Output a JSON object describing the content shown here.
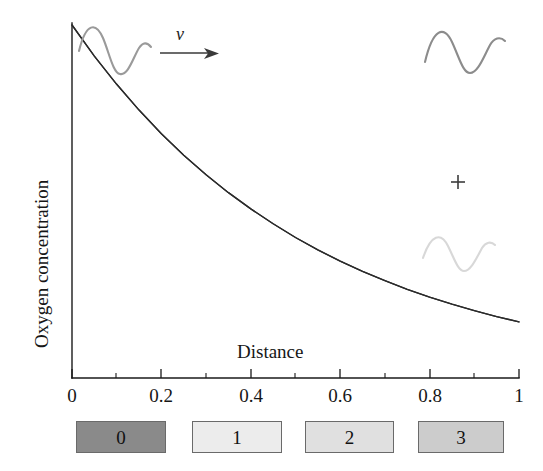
{
  "chart_data": {
    "type": "line",
    "title": "",
    "xlabel": "Distance",
    "ylabel": "Oxygen concentration",
    "xlim": [
      0,
      1
    ],
    "ylim": [
      0,
      1
    ],
    "grid": false,
    "legend_position": "below-axes",
    "x_tick_labels": [
      "0",
      "0.2",
      "0.4",
      "0.6",
      "0.8",
      "1"
    ],
    "x_tick_values": [
      0,
      0.2,
      0.4,
      0.6,
      0.8,
      1
    ],
    "x_minor_tick_values": [
      0.1,
      0.3,
      0.5,
      0.7,
      0.9
    ],
    "y_tick_labels": [],
    "series": [
      {
        "name": "Oxygen concentration profile",
        "style": "exponential-decay",
        "color": "#2b2b2b",
        "x": [
          0.0,
          0.05,
          0.1,
          0.15,
          0.2,
          0.25,
          0.3,
          0.35,
          0.4,
          0.45,
          0.5,
          0.55,
          0.6,
          0.65,
          0.7,
          0.75,
          0.8,
          0.85,
          0.9,
          0.95,
          1.0
        ],
        "values": [
          1.0,
          0.912,
          0.832,
          0.759,
          0.692,
          0.631,
          0.576,
          0.525,
          0.479,
          0.437,
          0.398,
          0.363,
          0.331,
          0.302,
          0.276,
          0.251,
          0.229,
          0.209,
          0.191,
          0.174,
          0.159
        ]
      }
    ],
    "annotations": [
      {
        "name": "velocity-arrow",
        "label": "v",
        "x": 0.17,
        "y": 0.94,
        "description": "arrow pointing right labelled v"
      },
      {
        "name": "plus-operator",
        "label": "+",
        "x": 0.865,
        "y": 0.555
      },
      {
        "name": "wave-on-curve",
        "label": "",
        "x": 0.1,
        "y": 0.93,
        "color": "#9a9a9a"
      },
      {
        "name": "wave-upper-right",
        "label": "",
        "x": 0.875,
        "y": 0.87,
        "color": "#8c8c8c"
      },
      {
        "name": "wave-lower-right",
        "label": "",
        "x": 0.865,
        "y": 0.34,
        "color": "#d8d8d8"
      }
    ],
    "legend_entries": [
      {
        "label": "0",
        "color": "#8a8a8a"
      },
      {
        "label": "1",
        "color": "#ececec"
      },
      {
        "label": "2",
        "color": "#e0e0e0"
      },
      {
        "label": "3",
        "color": "#cccccc"
      }
    ]
  }
}
